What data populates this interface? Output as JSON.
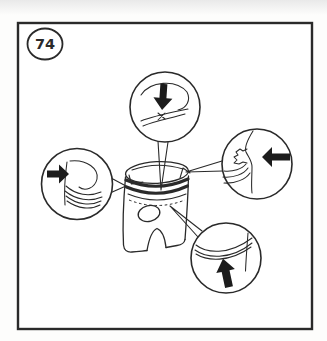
{
  "figure": {
    "number": "74"
  },
  "colors": {
    "ink": "#2a2a2a",
    "paper": "#ffffff",
    "arrow_fill": "#1c1c1c"
  },
  "callouts": [
    {
      "id": "top",
      "arrow_icon": "arrow-down-icon",
      "arrow_direction": "down"
    },
    {
      "id": "right",
      "arrow_icon": "arrow-left-icon",
      "arrow_direction": "left"
    },
    {
      "id": "left",
      "arrow_icon": "arrow-right-icon",
      "arrow_direction": "right"
    },
    {
      "id": "bottom",
      "arrow_icon": "arrow-up-icon",
      "arrow_direction": "up"
    }
  ]
}
